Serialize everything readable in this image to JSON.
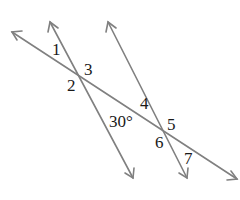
{
  "diagram": {
    "line_color": "#808080",
    "label_color": "#1a1a1a",
    "lines": {
      "transversal": {
        "x1": 12,
        "y1": 32,
        "x2": 237,
        "y2": 179
      },
      "parallel_left": {
        "x1": 50,
        "y1": 22,
        "x2": 133,
        "y2": 178
      },
      "parallel_right": {
        "x1": 108,
        "y1": 22,
        "x2": 187,
        "y2": 178
      }
    },
    "angle_labels": [
      {
        "id": "1",
        "text": "1",
        "x": 52,
        "y": 44
      },
      {
        "id": "2",
        "text": "2",
        "x": 67,
        "y": 79
      },
      {
        "id": "3",
        "text": "3",
        "x": 85,
        "y": 63
      },
      {
        "id": "4",
        "text": "4",
        "x": 145,
        "y": 97
      },
      {
        "id": "5",
        "text": "5",
        "x": 167,
        "y": 116
      },
      {
        "id": "6",
        "text": "6",
        "x": 158,
        "y": 135
      },
      {
        "id": "7",
        "text": "7",
        "x": 180,
        "y": 150
      },
      {
        "id": "given",
        "text": "30°",
        "x": 109,
        "y": 113
      }
    ]
  }
}
